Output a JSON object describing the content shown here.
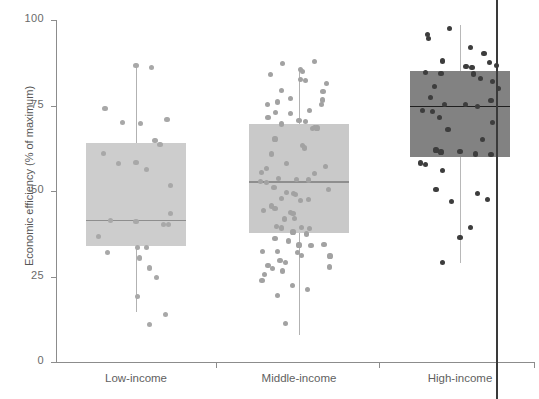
{
  "chart_data": {
    "type": "box",
    "title": "",
    "xlabel": "",
    "ylabel": "Economic efficiency (% of maximum)",
    "ylim": [
      0,
      100
    ],
    "yticks": [
      0,
      25,
      50,
      75,
      100
    ],
    "ytick_labels": [
      "0",
      "25",
      "50",
      "75",
      "100"
    ],
    "grid": false,
    "legend": "none",
    "categories": [
      "Low-income",
      "Middle-income",
      "High-income"
    ],
    "overlay": "jittered scatter points of individual observations",
    "series": [
      {
        "name": "Low-income",
        "color": "#cdcdcd",
        "point_color": "#a8a8a8",
        "median": 41.5,
        "q1": 34.0,
        "q3": 64.0,
        "whisker_low": 14.5,
        "whisker_high": 87.0,
        "points": [
          [
            0.5,
            86.8
          ],
          [
            0.68,
            86.2
          ],
          [
            0.14,
            74.2
          ],
          [
            0.55,
            69.8
          ],
          [
            0.34,
            70.0
          ],
          [
            0.86,
            71.0
          ],
          [
            0.72,
            64.8
          ],
          [
            0.78,
            63.5
          ],
          [
            0.12,
            60.9
          ],
          [
            0.3,
            58.0
          ],
          [
            0.5,
            58.3
          ],
          [
            0.62,
            56.4
          ],
          [
            0.9,
            51.5
          ],
          [
            0.9,
            43.5
          ],
          [
            0.2,
            41.4
          ],
          [
            0.5,
            41.2
          ],
          [
            0.82,
            40.3
          ],
          [
            0.88,
            40.2
          ],
          [
            0.06,
            36.6
          ],
          [
            0.52,
            33.5
          ],
          [
            0.62,
            33.4
          ],
          [
            0.17,
            32.0
          ],
          [
            0.54,
            30.4
          ],
          [
            0.66,
            27.5
          ],
          [
            0.74,
            24.8
          ],
          [
            0.52,
            19.2
          ],
          [
            0.84,
            13.8
          ],
          [
            0.66,
            11.0
          ]
        ]
      },
      {
        "name": "Middle-income",
        "color": "#c9c9c9",
        "point_color": "#a2a2a2",
        "median": 52.8,
        "q1": 37.6,
        "q3": 69.6,
        "whisker_low": 8.0,
        "whisker_high": 86.0,
        "points": [
          [
            0.31,
            87.2
          ],
          [
            0.52,
            85.6
          ],
          [
            0.54,
            85.0
          ],
          [
            0.68,
            87.8
          ],
          [
            0.17,
            84.0
          ],
          [
            0.52,
            82.6
          ],
          [
            0.58,
            82.2
          ],
          [
            0.82,
            81.4
          ],
          [
            0.3,
            79.4
          ],
          [
            0.78,
            79.0
          ],
          [
            0.77,
            76.6
          ],
          [
            0.76,
            75.2
          ],
          [
            0.25,
            76.0
          ],
          [
            0.4,
            77.0
          ],
          [
            0.13,
            75.4
          ],
          [
            0.23,
            73.0
          ],
          [
            0.4,
            72.6
          ],
          [
            0.62,
            73.6
          ],
          [
            0.14,
            71.4
          ],
          [
            0.5,
            70.6
          ],
          [
            0.58,
            70.4
          ],
          [
            0.3,
            69.6
          ],
          [
            0.66,
            68.2
          ],
          [
            0.68,
            68.6
          ],
          [
            0.71,
            68.4
          ],
          [
            0.22,
            65.2
          ],
          [
            0.54,
            63.2
          ],
          [
            0.56,
            62.6
          ],
          [
            0.18,
            60.8
          ],
          [
            0.35,
            58.0
          ],
          [
            0.12,
            56.6
          ],
          [
            0.81,
            57.2
          ],
          [
            0.68,
            55.2
          ],
          [
            0.06,
            55.4
          ],
          [
            0.26,
            53.6
          ],
          [
            0.47,
            53.4
          ],
          [
            0.61,
            53.2
          ],
          [
            0.05,
            52.8
          ],
          [
            0.12,
            52.6
          ],
          [
            0.21,
            51.0
          ],
          [
            0.84,
            50.4
          ],
          [
            0.35,
            49.6
          ],
          [
            0.44,
            49.2
          ],
          [
            0.46,
            49.0
          ],
          [
            0.3,
            47.8
          ],
          [
            0.52,
            47.2
          ],
          [
            0.61,
            47.4
          ],
          [
            0.18,
            45.6
          ],
          [
            0.22,
            45.0
          ],
          [
            0.09,
            44.2
          ],
          [
            0.4,
            43.6
          ],
          [
            0.43,
            43.4
          ],
          [
            0.33,
            41.8
          ],
          [
            0.45,
            42.0
          ],
          [
            0.24,
            39.6
          ],
          [
            0.3,
            39.2
          ],
          [
            0.53,
            39.4
          ],
          [
            0.62,
            39.0
          ],
          [
            0.43,
            38.0
          ],
          [
            0.59,
            37.4
          ],
          [
            0.22,
            36.0
          ],
          [
            0.38,
            35.4
          ],
          [
            0.5,
            34.2
          ],
          [
            0.64,
            34.0
          ],
          [
            0.79,
            34.4
          ],
          [
            0.08,
            32.4
          ],
          [
            0.25,
            32.2
          ],
          [
            0.48,
            32.0
          ],
          [
            0.53,
            31.2
          ],
          [
            0.86,
            31.0
          ],
          [
            0.28,
            29.6
          ],
          [
            0.34,
            29.0
          ],
          [
            0.14,
            28.2
          ],
          [
            0.19,
            27.4
          ],
          [
            0.31,
            26.6
          ],
          [
            0.85,
            27.8
          ],
          [
            0.1,
            25.6
          ],
          [
            0.07,
            23.8
          ],
          [
            0.42,
            22.4
          ],
          [
            0.6,
            21.2
          ],
          [
            0.25,
            19.4
          ],
          [
            0.34,
            11.2
          ]
        ]
      },
      {
        "name": "High-income",
        "color": "#828282",
        "point_color": "#3d3d3d",
        "median": 75.0,
        "q1": 60.0,
        "q3": 85.0,
        "whisker_low": 29.0,
        "whisker_high": 98.5,
        "points": [
          [
            0.38,
            97.5
          ],
          [
            0.12,
            95.8
          ],
          [
            0.13,
            94.6
          ],
          [
            0.62,
            92.0
          ],
          [
            0.78,
            90.2
          ],
          [
            0.3,
            88.0
          ],
          [
            0.84,
            87.6
          ],
          [
            0.57,
            86.5
          ],
          [
            0.64,
            86.0
          ],
          [
            0.92,
            86.6
          ],
          [
            0.66,
            84.2
          ],
          [
            0.1,
            84.6
          ],
          [
            0.28,
            84.4
          ],
          [
            0.74,
            82.8
          ],
          [
            0.88,
            82.0
          ],
          [
            0.2,
            80.6
          ],
          [
            0.95,
            80.0
          ],
          [
            0.16,
            77.4
          ],
          [
            0.86,
            76.4
          ],
          [
            0.32,
            75.2
          ],
          [
            0.56,
            75.4
          ],
          [
            0.7,
            74.8
          ],
          [
            0.06,
            73.6
          ],
          [
            0.18,
            73.2
          ],
          [
            0.26,
            71.6
          ],
          [
            0.88,
            70.0
          ],
          [
            0.36,
            68.0
          ],
          [
            0.76,
            65.0
          ],
          [
            0.22,
            62.0
          ],
          [
            0.28,
            61.4
          ],
          [
            0.5,
            61.6
          ],
          [
            0.68,
            60.8
          ],
          [
            0.86,
            60.6
          ],
          [
            0.04,
            58.2
          ],
          [
            0.1,
            57.8
          ],
          [
            0.3,
            56.0
          ],
          [
            0.22,
            50.4
          ],
          [
            0.7,
            49.2
          ],
          [
            0.82,
            47.6
          ],
          [
            0.4,
            47.0
          ],
          [
            0.62,
            39.4
          ],
          [
            0.5,
            36.4
          ],
          [
            0.3,
            29.2
          ]
        ]
      }
    ]
  },
  "artifact": {
    "page_edge_label": "page-edge-line"
  }
}
